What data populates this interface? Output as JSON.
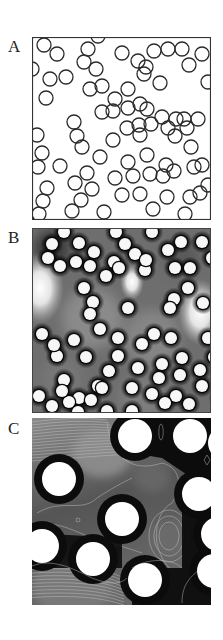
{
  "figure": {
    "panels": [
      {
        "label": "A",
        "kind": "particle-outlines",
        "box": {
          "x": 32,
          "y": 37,
          "w": 179,
          "h": 183
        },
        "circle_radius": 7,
        "circles": [
          [
            12,
            8
          ],
          [
            25,
            17
          ],
          [
            56,
            12
          ],
          [
            66,
            -1
          ],
          [
            52,
            25
          ],
          [
            64,
            32
          ],
          [
            90,
            16
          ],
          [
            0,
            32
          ],
          [
            18,
            42
          ],
          [
            34,
            40
          ],
          [
            122,
            14
          ],
          [
            136,
            12
          ],
          [
            150,
            12
          ],
          [
            170,
            17
          ],
          [
            157,
            28
          ],
          [
            114,
            30
          ],
          [
            106,
            24
          ],
          [
            112,
            37
          ],
          [
            176,
            45
          ],
          [
            128,
            46
          ],
          [
            58,
            52
          ],
          [
            70,
            49
          ],
          [
            14,
            61
          ],
          [
            83,
            62
          ],
          [
            96,
            52
          ],
          [
            96,
            71
          ],
          [
            108,
            67
          ],
          [
            70,
            75
          ],
          [
            81,
            74
          ],
          [
            115,
            72
          ],
          [
            130,
            80
          ],
          [
            144,
            82
          ],
          [
            152,
            82
          ],
          [
            166,
            82
          ],
          [
            119,
            87
          ],
          [
            95,
            91
          ],
          [
            107,
            88
          ],
          [
            136,
            91
          ],
          [
            155,
            91
          ],
          [
            143,
            99
          ],
          [
            42,
            85
          ],
          [
            5,
            98
          ],
          [
            45,
            99
          ],
          [
            50,
            110
          ],
          [
            81,
            103
          ],
          [
            108,
            98
          ],
          [
            10,
            116
          ],
          [
            115,
            118
          ],
          [
            159,
            110
          ],
          [
            68,
            120
          ],
          [
            6,
            130
          ],
          [
            28,
            129
          ],
          [
            55,
            136
          ],
          [
            96,
            125
          ],
          [
            134,
            128
          ],
          [
            142,
            134
          ],
          [
            170,
            128
          ],
          [
            162,
            130
          ],
          [
            83,
            141
          ],
          [
            101,
            139
          ],
          [
            118,
            137
          ],
          [
            131,
            139
          ],
          [
            15,
            151
          ],
          [
            43,
            146
          ],
          [
            60,
            152
          ],
          [
            168,
            156
          ],
          [
            176,
            148
          ],
          [
            11,
            164
          ],
          [
            49,
            163
          ],
          [
            90,
            158
          ],
          [
            108,
            157
          ],
          [
            135,
            160
          ],
          [
            158,
            160
          ],
          [
            7,
            177
          ],
          [
            40,
            174
          ],
          [
            72,
            175
          ],
          [
            121,
            172
          ],
          [
            153,
            177
          ]
        ]
      },
      {
        "label": "B",
        "kind": "grayscale-density-map",
        "box": {
          "x": 32,
          "y": 228,
          "w": 179,
          "h": 185
        },
        "circle_radius": 6,
        "bright_regions": [
          [
            8,
            60,
            24
          ],
          [
            168,
            84,
            22
          ],
          [
            100,
            54,
            12
          ]
        ],
        "circles": [
          [
            32,
            4
          ],
          [
            84,
            4
          ],
          [
            120,
            4
          ],
          [
            20,
            16
          ],
          [
            47,
            15
          ],
          [
            62,
            24
          ],
          [
            93,
            16
          ],
          [
            103,
            26
          ],
          [
            113,
            42
          ],
          [
            136,
            22
          ],
          [
            149,
            14
          ],
          [
            170,
            14
          ],
          [
            180,
            30
          ],
          [
            58,
            38
          ],
          [
            82,
            34
          ],
          [
            143,
            40
          ],
          [
            158,
            40
          ],
          [
            16,
            30
          ],
          [
            28,
            38
          ],
          [
            74,
            48
          ],
          [
            87,
            40
          ],
          [
            114,
            32
          ],
          [
            44,
            34
          ],
          [
            52,
            60
          ],
          [
            61,
            74
          ],
          [
            96,
            80
          ],
          [
            142,
            71
          ],
          [
            156,
            60
          ],
          [
            171,
            75
          ],
          [
            68,
            101
          ],
          [
            58,
            86
          ],
          [
            42,
            112
          ],
          [
            10,
            106
          ],
          [
            25,
            128
          ],
          [
            32,
            152
          ],
          [
            54,
            129
          ],
          [
            66,
            158
          ],
          [
            77,
            143
          ],
          [
            86,
            128
          ],
          [
            86,
            110
          ],
          [
            106,
            140
          ],
          [
            110,
            116
          ],
          [
            122,
            106
          ],
          [
            138,
            80
          ],
          [
            139,
            110
          ],
          [
            148,
            147
          ],
          [
            168,
            142
          ],
          [
            170,
            158
          ],
          [
            182,
            129
          ],
          [
            188,
            170
          ],
          [
            47,
            170
          ],
          [
            37,
            174
          ],
          [
            59,
            172
          ],
          [
            70,
            160
          ],
          [
            30,
            163
          ],
          [
            100,
            160
          ],
          [
            120,
            166
          ],
          [
            127,
            150
          ],
          [
            157,
            176
          ],
          [
            144,
            168
          ],
          [
            20,
            178
          ],
          [
            7,
            168
          ],
          [
            176,
            110
          ],
          [
            22,
            117
          ],
          [
            150,
            130
          ],
          [
            130,
            136
          ],
          [
            133,
            175
          ],
          [
            75,
            183
          ],
          [
            100,
            183
          ],
          [
            46,
            184
          ]
        ]
      },
      {
        "label": "C",
        "kind": "contour-map",
        "box": {
          "x": 32,
          "y": 418,
          "w": 179,
          "h": 187
        },
        "circle_radius": 17,
        "circles": [
          [
            103,
            18
          ],
          [
            158,
            18
          ],
          [
            193,
            25
          ],
          [
            27,
            61
          ],
          [
            90,
            101
          ],
          [
            167,
            76
          ],
          [
            186,
            116
          ],
          [
            10,
            128
          ],
          [
            61,
            141
          ],
          [
            113,
            162
          ],
          [
            182,
            153
          ]
        ]
      }
    ]
  }
}
